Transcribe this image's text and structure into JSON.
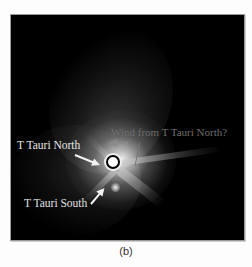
{
  "figure": {
    "panel_caption": "(b)",
    "labels": {
      "north": "T Tauri North",
      "south": "T Tauri South",
      "wind": "Wind from T Tauri North?"
    },
    "colors": {
      "background": "#000000",
      "label_primary": "#e8e8e8",
      "label_wind": "#6e6e6e",
      "arrow_primary": "#f2f2f2",
      "arrow_wind": "#8a8a8a"
    }
  }
}
